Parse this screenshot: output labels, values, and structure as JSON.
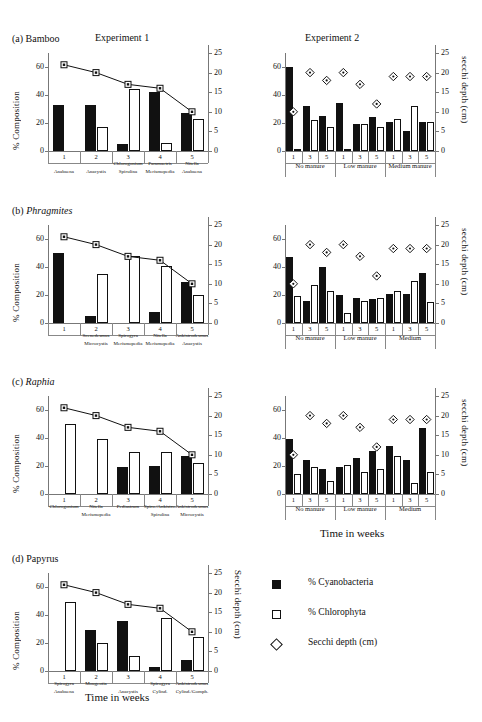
{
  "axes": {
    "ylabel_left": "% Composition",
    "ylabel_right": "secchi depth (cm)",
    "ylabel_right_d": "Secchi depth (cm)",
    "xlabel": "Time in weeks",
    "left_ticks": [
      "0",
      "20",
      "40",
      "60"
    ],
    "right_ticks": [
      "0",
      "5",
      "10",
      "15",
      "20",
      "25"
    ],
    "ylim_left": [
      0,
      70
    ],
    "ylim_right": [
      0,
      25
    ]
  },
  "headers": {
    "exp1": "Experiment 1",
    "exp2": "Experiment 2"
  },
  "legend": {
    "items": [
      {
        "icon": "filled-square",
        "label": "% Cyanobacteria"
      },
      {
        "icon": "open-square",
        "label": "% Chlorophyta"
      },
      {
        "icon": "open-diamond",
        "label": "Secchi depth (cm)"
      }
    ]
  },
  "panels": [
    {
      "id": "a",
      "tag": "(a)",
      "name": "Bamboo",
      "italic": false,
      "exp1": {
        "type": "bar",
        "categories": [
          "1",
          "2",
          "3",
          "4",
          "5"
        ],
        "row1": [
          "",
          "",
          "Chlorogonium",
          "Paramaetris",
          "Nitella"
        ],
        "row2": [
          "Anabaena",
          "Anacystis",
          "Spirulina",
          "Merismopedia",
          "Anabaena"
        ],
        "series": [
          {
            "name": "% Cyanobacteria",
            "values": [
              33,
              33,
              5,
              42,
              27
            ]
          },
          {
            "name": "% Chlorophyta",
            "values": [
              0,
              17,
              44,
              6,
              23
            ]
          }
        ],
        "secchi": [
          22,
          20,
          17,
          16,
          10
        ]
      },
      "exp2": {
        "type": "bar",
        "categories": [
          "1",
          "3",
          "5",
          "1",
          "3",
          "5",
          "1",
          "3",
          "5"
        ],
        "groups": [
          "No manure",
          "Low manure",
          "Medium manure"
        ],
        "series": [
          {
            "name": "% Cyanobacteria",
            "values": [
              60,
              32,
              25,
              34,
              19,
              24,
              21,
              14,
              21
            ]
          },
          {
            "name": "% Chlorophyta",
            "values": [
              1,
              22,
              17,
              1,
              19,
              17,
              23,
              32,
              21
            ]
          }
        ],
        "secchi": [
          10,
          20,
          18,
          20,
          17,
          12,
          19,
          19,
          19
        ]
      }
    },
    {
      "id": "b",
      "tag": "(b)",
      "name": "Phragmites",
      "italic": true,
      "exp1": {
        "type": "bar",
        "categories": [
          "1",
          "2",
          "3",
          "4",
          "5"
        ],
        "row1": [
          "",
          "Scenedesmus",
          "Spirogyra",
          "Nitella",
          "Ankistrodesmus"
        ],
        "row2": [
          "",
          "Microcystis",
          "Merismopedia",
          "Merismopedia",
          "Anacystis"
        ],
        "series": [
          {
            "name": "% Cyanobacteria",
            "values": [
              50,
              5,
              0,
              8,
              29
            ]
          },
          {
            "name": "% Chlorophyta",
            "values": [
              0,
              35,
              48,
              41,
              20
            ]
          }
        ],
        "secchi": [
          22,
          20,
          17,
          16,
          10
        ]
      },
      "exp2": {
        "type": "bar",
        "categories": [
          "1",
          "3",
          "5",
          "1",
          "3",
          "5",
          "1",
          "3",
          "5"
        ],
        "groups": [
          "No manure",
          "Low manure",
          "Medium"
        ],
        "series": [
          {
            "name": "% Cyanobacteria",
            "values": [
              47,
              16,
              40,
              20,
              18,
              17,
              21,
              21,
              36
            ]
          },
          {
            "name": "% Chlorophyta",
            "values": [
              19,
              27,
              23,
              7,
              16,
              18,
              23,
              30,
              15
            ]
          }
        ],
        "secchi": [
          10,
          20,
          18,
          20,
          17,
          12,
          19,
          19,
          19
        ]
      }
    },
    {
      "id": "c",
      "tag": "(c)",
      "name": "Raphia",
      "italic": true,
      "exp1": {
        "type": "bar",
        "categories": [
          "1",
          "2",
          "3",
          "4",
          "5"
        ],
        "row1": [
          "Chlorogonium",
          "Nitella",
          "Pediastrum",
          "Spiro./Ankistro.",
          "Ankistrodesmus"
        ],
        "row2": [
          "",
          "Merismopedia",
          "",
          "Spirulina",
          "Microcystis"
        ],
        "series": [
          {
            "name": "% Cyanobacteria",
            "values": [
              0,
              0,
              19,
              20,
              27
            ]
          },
          {
            "name": "% Chlorophyta",
            "values": [
              50,
              39,
              30,
              30,
              22
            ]
          }
        ],
        "secchi": [
          22,
          20,
          17,
          16,
          10
        ]
      },
      "exp2": {
        "type": "bar",
        "categories": [
          "1",
          "3",
          "5",
          "1",
          "3",
          "5",
          "1",
          "3",
          "5"
        ],
        "groups": [
          "No manure",
          "Low manure",
          "Medium"
        ],
        "series": [
          {
            "name": "% Cyanobacteria",
            "values": [
              39,
              24,
              18,
              19,
              26,
              31,
              34,
              24,
              47
            ]
          },
          {
            "name": "% Chlorophyta",
            "values": [
              14,
              19,
              9,
              21,
              16,
              18,
              27,
              8,
              16
            ]
          }
        ],
        "secchi": [
          10,
          20,
          18,
          20,
          17,
          12,
          19,
          19,
          19
        ]
      }
    },
    {
      "id": "d",
      "tag": "(d)",
      "name": "Papyrus",
      "italic": false,
      "exp1": {
        "type": "bar",
        "categories": [
          "1",
          "2",
          "3",
          "4",
          "5"
        ],
        "row1": [
          "Spirogyra",
          "Mougeotia",
          "",
          "Spirogyra",
          "Ankistrodesmus"
        ],
        "row2": [
          "Anabaena",
          "",
          "Anacystis",
          "Cylind.",
          "Cylind./Gomph."
        ],
        "series": [
          {
            "name": "% Cyanobacteria",
            "values": [
              0,
              29,
              36,
              3,
              8
            ]
          },
          {
            "name": "% Chlorophyta",
            "values": [
              49,
              20,
              11,
              38,
              24
            ]
          }
        ],
        "secchi": [
          22,
          20,
          17,
          16,
          10
        ]
      }
    }
  ]
}
